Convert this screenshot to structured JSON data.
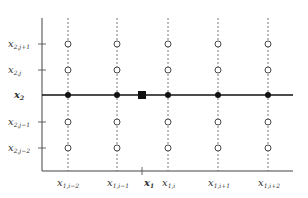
{
  "diagram": {
    "axes": {
      "origin": [
        42,
        171
      ],
      "x_end": 293,
      "y_top": 18,
      "color": "#333333"
    },
    "interpolation_line": {
      "y": 95,
      "label_main": "x",
      "label_sub": "2",
      "color": "#111111"
    },
    "columns": [
      {
        "x": 68,
        "label_main": "x",
        "label_sub": "1,i−2"
      },
      {
        "x": 117,
        "label_main": "x",
        "label_sub": "1,i−1"
      },
      {
        "x": 168,
        "label_main": "x",
        "label_sub": "1,i"
      },
      {
        "x": 218,
        "label_main": "x",
        "label_sub": "1,i+1"
      },
      {
        "x": 268,
        "label_main": "x",
        "label_sub": "1,i+2"
      }
    ],
    "rows": [
      {
        "y": 44,
        "label_main": "x",
        "label_sub": "2,j+1"
      },
      {
        "y": 70,
        "label_main": "x",
        "label_sub": "2,j"
      },
      {
        "y": 122,
        "label_main": "x",
        "label_sub": "2,j−1"
      },
      {
        "y": 148,
        "label_main": "x",
        "label_sub": "2,j−2"
      }
    ],
    "target_point": {
      "x": 142,
      "y": 95,
      "shape": "filled-square",
      "axis_label_main": "x",
      "axis_label_sub": "1"
    },
    "legend": {
      "open_circle": "grid node",
      "filled_dot": "intermediate interpolated value",
      "filled_square": "target point"
    }
  }
}
